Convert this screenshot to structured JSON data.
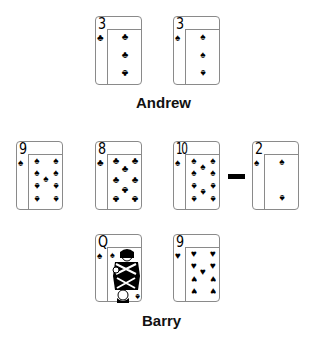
{
  "players": {
    "top": {
      "name": "Andrew",
      "cards": [
        {
          "rank": "3",
          "suit": "♣",
          "suit_name": "clubs"
        },
        {
          "rank": "3",
          "suit": "♠",
          "suit_name": "spades"
        }
      ]
    },
    "bottom": {
      "name": "Barry",
      "cards": [
        {
          "rank": "Q",
          "suit": "♠",
          "suit_name": "spades"
        },
        {
          "rank": "9",
          "suit": "♥",
          "suit_name": "hearts"
        }
      ]
    }
  },
  "board": {
    "cards": [
      {
        "rank": "9",
        "suit": "♠",
        "suit_name": "spades"
      },
      {
        "rank": "8",
        "suit": "♣",
        "suit_name": "clubs"
      },
      {
        "rank": "10",
        "suit": "♠",
        "suit_name": "spades"
      },
      {
        "rank": "2",
        "suit": "♠",
        "suit_name": "spades"
      }
    ],
    "separator": "—"
  }
}
